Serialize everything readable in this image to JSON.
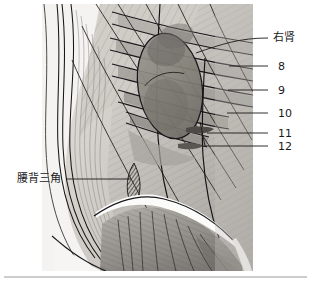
{
  "figure": {
    "kind": "anatomical-illustration",
    "title_text": "",
    "region": "posterior lumbar region, right side",
    "palette": {
      "background": "#ffffff",
      "skin_light": "#e2e0dc",
      "skin_mid": "#c9c6c1",
      "muscle_mid": "#a9a6a1",
      "muscle_dark": "#8a8782",
      "kidney_fill": "#8f8c88",
      "kidney_dark": "#6f6c68",
      "outline": "#1a1a1a",
      "hatch": "#55524e",
      "separator": "#9a9a9a",
      "label_text": "#1a1a1a",
      "leader_line": "#1a1a1a"
    },
    "canvas": {
      "width": 311,
      "height": 289
    },
    "illustration_box": {
      "x": 42,
      "y": 4,
      "width": 211,
      "height": 267
    },
    "separator_line": {
      "y": 277,
      "x1": 4,
      "x2": 307
    }
  },
  "labels": [
    {
      "id": "right-kidney",
      "text": "右肾",
      "x": 273,
      "y": 32,
      "leader": {
        "x1": 268,
        "y1": 38,
        "x2": 196,
        "y2": 53
      }
    },
    {
      "id": "rib-8",
      "text": "8",
      "x": 278,
      "y": 61,
      "leader": {
        "x1": 268,
        "y1": 66,
        "x2": 229,
        "y2": 66
      }
    },
    {
      "id": "rib-9",
      "text": "9",
      "x": 278,
      "y": 85,
      "leader": {
        "x1": 268,
        "y1": 90,
        "x2": 228,
        "y2": 90
      }
    },
    {
      "id": "rib-10",
      "text": "10",
      "x": 278,
      "y": 108,
      "leader": {
        "x1": 268,
        "y1": 113,
        "x2": 227,
        "y2": 113
      }
    },
    {
      "id": "rib-11",
      "text": "11",
      "x": 278,
      "y": 128,
      "leader": {
        "x1": 268,
        "y1": 133,
        "x2": 207,
        "y2": 133
      }
    },
    {
      "id": "rib-12",
      "text": "12",
      "x": 278,
      "y": 141,
      "leader": {
        "x1": 268,
        "y1": 146,
        "x2": 200,
        "y2": 122
      }
    },
    {
      "id": "lumbar-triangle",
      "text": "腰背三角",
      "x": 17,
      "y": 173,
      "leader": {
        "x1": 66,
        "y1": 179,
        "x2": 131,
        "y2": 179
      }
    }
  ]
}
